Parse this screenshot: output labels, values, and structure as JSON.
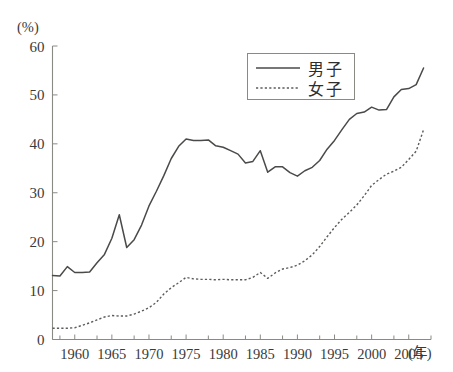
{
  "chart_data": {
    "type": "line",
    "title": "",
    "xlabel": "(年)",
    "ylabel": "(%)",
    "xlim": [
      1957,
      2008
    ],
    "ylim": [
      0,
      60
    ],
    "grid": false,
    "legend_position": "top-right",
    "y_ticks": [
      0,
      10,
      20,
      30,
      40,
      50,
      60
    ],
    "y_tick_labels": [
      "0",
      "10",
      "20",
      "30",
      "40",
      "50",
      "60"
    ],
    "x_ticks": [
      1960,
      1965,
      1970,
      1975,
      1980,
      1985,
      1990,
      1995,
      2000,
      2005
    ],
    "x_tick_labels": [
      "1960",
      "1965",
      "1970",
      "1975",
      "1980",
      "1985",
      "1990",
      "1995",
      "2000",
      "2005"
    ],
    "x_minor_ticks": [
      1958,
      1963,
      1968,
      1973,
      1978,
      1983,
      1988,
      1993,
      1998,
      2003,
      2008
    ],
    "series": [
      {
        "name": "男子",
        "style": "solid",
        "color": "#4a4a48",
        "x": [
          1957,
          1958,
          1959,
          1960,
          1961,
          1962,
          1963,
          1964,
          1965,
          1966,
          1967,
          1968,
          1969,
          1970,
          1971,
          1972,
          1973,
          1974,
          1975,
          1976,
          1977,
          1978,
          1979,
          1980,
          1981,
          1982,
          1983,
          1984,
          1985,
          1986,
          1987,
          1988,
          1989,
          1990,
          1991,
          1992,
          1993,
          1994,
          1995,
          1996,
          1997,
          1998,
          1999,
          2000,
          2001,
          2002,
          2003,
          2004,
          2005,
          2006,
          2007
        ],
        "values": [
          13.1,
          13.0,
          14.9,
          13.7,
          13.7,
          13.8,
          15.7,
          17.4,
          20.7,
          25.5,
          18.8,
          20.4,
          23.4,
          27.3,
          30.3,
          33.5,
          37.0,
          39.5,
          41.0,
          40.7,
          40.7,
          40.8,
          39.6,
          39.3,
          38.6,
          37.9,
          36.1,
          36.4,
          38.6,
          34.2,
          35.3,
          35.3,
          34.1,
          33.4,
          34.5,
          35.2,
          36.6,
          38.9,
          40.7,
          42.9,
          45.0,
          46.2,
          46.5,
          47.5,
          46.9,
          47.0,
          49.6,
          51.1,
          51.3,
          52.1,
          55.5
        ]
      },
      {
        "name": "女子",
        "style": "dashed",
        "color": "#5c5c5a",
        "x": [
          1957,
          1958,
          1959,
          1960,
          1961,
          1962,
          1963,
          1964,
          1965,
          1966,
          1967,
          1968,
          1969,
          1970,
          1971,
          1972,
          1973,
          1974,
          1975,
          1976,
          1977,
          1978,
          1979,
          1980,
          1981,
          1982,
          1983,
          1984,
          1985,
          1986,
          1987,
          1988,
          1989,
          1990,
          1991,
          1992,
          1993,
          1994,
          1995,
          1996,
          1997,
          1998,
          1999,
          2000,
          2001,
          2002,
          2003,
          2004,
          2005,
          2006,
          2007
        ],
        "values": [
          2.3,
          2.3,
          2.3,
          2.4,
          2.9,
          3.4,
          4.0,
          4.6,
          4.9,
          4.8,
          4.8,
          5.2,
          5.8,
          6.5,
          7.6,
          9.3,
          10.6,
          11.6,
          12.7,
          12.4,
          12.3,
          12.3,
          12.2,
          12.3,
          12.2,
          12.2,
          12.2,
          12.7,
          13.7,
          12.5,
          13.6,
          14.4,
          14.7,
          15.2,
          16.1,
          17.3,
          19.0,
          21.0,
          22.9,
          24.6,
          26.0,
          27.5,
          29.4,
          31.5,
          32.7,
          33.8,
          34.4,
          35.2,
          36.8,
          38.5,
          42.9
        ]
      }
    ]
  },
  "legend": {
    "entries": [
      {
        "label": "男子",
        "style": "solid"
      },
      {
        "label": "女子",
        "style": "dashed"
      }
    ]
  },
  "axes": {
    "y_unit_label": "(%)",
    "x_unit_label": "(年)"
  }
}
